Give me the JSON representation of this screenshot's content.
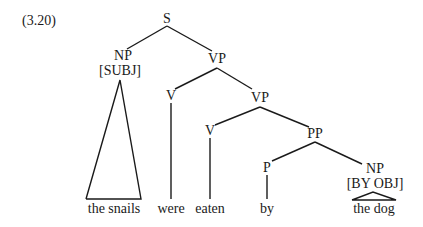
{
  "example_number": "(3.20)",
  "nodes": {
    "S": "S",
    "NP_subj": "NP",
    "NP_subj_feature": "[SUBJ]",
    "VP1": "VP",
    "V_were": "V",
    "VP2": "VP",
    "V_eaten": "V",
    "PP": "PP",
    "P": "P",
    "NP_byobj": "NP",
    "NP_byobj_feature": "[BY OBJ]"
  },
  "words": {
    "the_snails": "the snails",
    "were": "were",
    "eaten": "eaten",
    "by": "by",
    "the_dog": "the dog"
  },
  "colors": {
    "ink": "#1a1a1a",
    "background": "#ffffff"
  }
}
